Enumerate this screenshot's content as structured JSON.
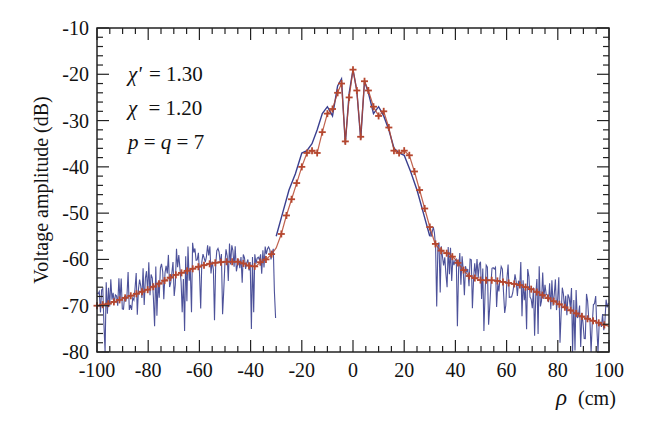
{
  "chart_data": {
    "type": "line",
    "title": "",
    "xlabel_symbol": "ρ",
    "xlabel_unit": "(cm)",
    "ylabel": "Voltage amplitude (dB)",
    "xlim": [
      -100,
      100
    ],
    "ylim": [
      -80,
      -10
    ],
    "x_ticks": [
      -100,
      -80,
      -60,
      -40,
      -20,
      0,
      20,
      40,
      60,
      80,
      100
    ],
    "y_ticks": [
      -10,
      -20,
      -30,
      -40,
      -50,
      -60,
      -70,
      -80
    ],
    "x_minor_step": 5,
    "y_minor_step": 2,
    "grid": false,
    "legend": null,
    "annotations": [
      {
        "symbol": "χ'",
        "eq": "= 1.30"
      },
      {
        "symbol": "χ",
        "eq": "= 1.20"
      },
      {
        "symbol": "p = q = 7",
        "eq": ""
      }
    ],
    "series": [
      {
        "name": "measured (noisy)",
        "style": "line",
        "color": "#3a3f8f",
        "description": "Noisy measured trace; follows the smooth curve in the central lobe (|ρ|<30) and fluctuates strongly (down to the -80 floor) in the tails",
        "x": [
          -30,
          -27.5,
          -25,
          -22.5,
          -20,
          -18,
          -16,
          -14,
          -12,
          -10,
          -8,
          -6,
          -4.5,
          -3,
          -1.5,
          0,
          1.5,
          3,
          4.5,
          6,
          8,
          10,
          12,
          14,
          16,
          18,
          20,
          22.5,
          25,
          27.5,
          30
        ],
        "values": [
          -55,
          -50,
          -45,
          -41.5,
          -37,
          -36.5,
          -35,
          -32,
          -28.5,
          -27,
          -29,
          -22.5,
          -21,
          -35,
          -24,
          -19,
          -23.5,
          -34,
          -21.5,
          -24,
          -28.5,
          -27,
          -29,
          -32,
          -36,
          -37,
          -37.5,
          -41,
          -45,
          -50,
          -55
        ]
      },
      {
        "name": "simulated (markers)",
        "style": "line+cross-markers",
        "color": "#b5472f",
        "x": [
          -100,
          -95,
          -90,
          -85,
          -80,
          -75,
          -70,
          -65,
          -60,
          -55,
          -50,
          -45,
          -42,
          -40,
          -38,
          -36,
          -34,
          -32,
          -30,
          -28,
          -26,
          -24,
          -22,
          -20,
          -18,
          -16,
          -14,
          -12,
          -10,
          -8,
          -6,
          -4.5,
          -3,
          -1.5,
          0,
          1.5,
          3,
          4.5,
          6,
          8,
          10,
          12,
          14,
          16,
          18,
          20,
          22,
          24,
          26,
          28,
          30,
          32,
          34,
          36,
          38,
          40,
          42,
          45,
          50,
          55,
          60,
          65,
          70,
          75,
          80,
          85,
          90,
          95,
          100
        ],
        "values": [
          -70,
          -69.5,
          -68.5,
          -67.5,
          -66.5,
          -65,
          -63.5,
          -62.5,
          -61.5,
          -60.8,
          -60.5,
          -60.5,
          -61,
          -61.5,
          -61.5,
          -60.5,
          -60,
          -59,
          -57.5,
          -54.5,
          -50.5,
          -47,
          -43.5,
          -40,
          -37,
          -36.5,
          -37,
          -32.5,
          -28.5,
          -27.5,
          -24,
          -22,
          -34.5,
          -25,
          -19,
          -23.5,
          -33.5,
          -21.5,
          -23.5,
          -27,
          -29,
          -28,
          -31.5,
          -36.5,
          -37,
          -36.5,
          -37.5,
          -41,
          -45,
          -49,
          -53,
          -56.5,
          -58,
          -58.5,
          -59,
          -60,
          -61.5,
          -63.5,
          -64.5,
          -64.5,
          -65,
          -65.5,
          -66.5,
          -68,
          -69.5,
          -71,
          -72.5,
          -73.5,
          -74.5
        ]
      }
    ]
  },
  "axes": {
    "x_tick_labels": [
      "-100",
      "-80",
      "-60",
      "-40",
      "-20",
      "0",
      "20",
      "40",
      "60",
      "80",
      "100"
    ],
    "y_tick_labels": [
      "-10",
      "-20",
      "-30",
      "-40",
      "-50",
      "-60",
      "-70",
      "-80"
    ]
  },
  "labels": {
    "ylabel": "Voltage amplitude (dB)",
    "xlabel_symbol": "ρ",
    "xlabel_unit": "(cm)",
    "annot1_sym": "χ'",
    "annot1_eq": "= 1.30",
    "annot2_sym": "χ",
    "annot2_eq": "= 1.20",
    "annot3_p": "p",
    "annot3_mid": " = ",
    "annot3_q": "q",
    "annot3_end": " = 7"
  },
  "colors": {
    "measured": "#3a3f8f",
    "simulated": "#b5472f",
    "axis": "#222222"
  }
}
